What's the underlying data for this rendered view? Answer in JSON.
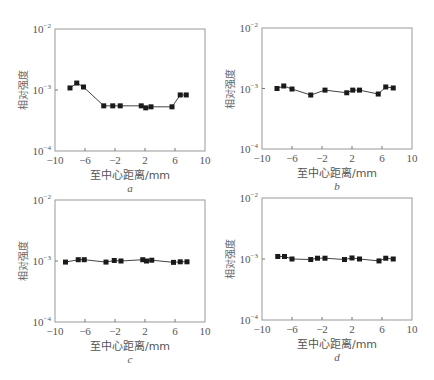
{
  "chart_data": [
    {
      "type": "scatter",
      "panel": "a",
      "xlabel": "至中心距离/mm",
      "ylabel": "相对强度",
      "xlim": [
        -10,
        10
      ],
      "ylim": [
        0.0001,
        0.01
      ],
      "yscale": "log",
      "xticks": [
        -10,
        -6,
        -2,
        2,
        6,
        10
      ],
      "yticks": [
        "10^-4",
        "10^-3",
        "10^-2"
      ],
      "series": [
        {
          "name": "a",
          "x": [
            -8.0,
            -7.1,
            -6.2,
            -3.5,
            -2.3,
            -1.3,
            1.5,
            2.1,
            2.8,
            5.6,
            6.7,
            7.5
          ],
          "y": [
            0.00108,
            0.0013,
            0.00112,
            0.00055,
            0.00055,
            0.00055,
            0.00055,
            0.00051,
            0.00053,
            0.00053,
            0.00083,
            0.00083
          ]
        }
      ]
    },
    {
      "type": "scatter",
      "panel": "b",
      "xlabel": "至中心距离/mm",
      "ylabel": "相对强度",
      "xlim": [
        -10,
        10
      ],
      "ylim": [
        0.0001,
        0.01
      ],
      "yscale": "log",
      "xticks": [
        -10,
        -6,
        -2,
        2,
        6,
        10
      ],
      "yticks": [
        "10^-4",
        "10^-3",
        "10^-2"
      ],
      "series": [
        {
          "name": "b",
          "x": [
            -8.0,
            -7.1,
            -6.0,
            -3.5,
            -1.6,
            1.3,
            2.1,
            3.0,
            5.5,
            6.5,
            7.5
          ],
          "y": [
            0.001,
            0.0011,
            0.00098,
            0.00078,
            0.00094,
            0.00085,
            0.00094,
            0.00094,
            0.00081,
            0.00106,
            0.00102
          ]
        }
      ]
    },
    {
      "type": "scatter",
      "panel": "c",
      "xlabel": "至中心距离/mm",
      "ylabel": "相对强度",
      "xlim": [
        -10,
        10
      ],
      "ylim": [
        0.0001,
        0.01
      ],
      "yscale": "log",
      "xticks": [
        -10,
        -6,
        -2,
        2,
        6,
        10
      ],
      "yticks": [
        "10^-4",
        "10^-3",
        "10^-2"
      ],
      "series": [
        {
          "name": "c",
          "x": [
            -8.6,
            -6.9,
            -6.1,
            -3.2,
            -2.1,
            -1.2,
            1.7,
            2.2,
            2.9,
            5.8,
            6.7,
            7.6
          ],
          "y": [
            0.00096,
            0.00105,
            0.00105,
            0.00096,
            0.00102,
            0.001,
            0.00105,
            0.001,
            0.00103,
            0.00095,
            0.00097,
            0.00097
          ]
        }
      ]
    },
    {
      "type": "scatter",
      "panel": "d",
      "xlabel": "至中心距离/mm",
      "ylabel": "相对强度",
      "xlim": [
        -10,
        10
      ],
      "ylim": [
        0.0001,
        0.01
      ],
      "yscale": "log",
      "xticks": [
        -10,
        -6,
        -2,
        2,
        6,
        10
      ],
      "yticks": [
        "10^-4",
        "10^-3",
        "10^-2"
      ],
      "series": [
        {
          "name": "d",
          "x": [
            -7.9,
            -7.0,
            -6.0,
            -3.5,
            -2.6,
            -1.6,
            1.0,
            2.0,
            3.0,
            5.6,
            6.5,
            7.5
          ],
          "y": [
            0.0011,
            0.0011,
            0.001,
            0.00098,
            0.00103,
            0.00103,
            0.00098,
            0.00104,
            0.001,
            0.00093,
            0.00103,
            0.001
          ]
        }
      ]
    }
  ],
  "panels": [
    {
      "letter": "a",
      "frame": {
        "x": 55,
        "y": 29,
        "w": 150,
        "h": 122
      }
    },
    {
      "letter": "b",
      "frame": {
        "x": 262,
        "y": 28,
        "w": 150,
        "h": 121
      }
    },
    {
      "letter": "c",
      "frame": {
        "x": 55,
        "y": 200,
        "w": 150,
        "h": 122
      }
    },
    {
      "letter": "d",
      "frame": {
        "x": 262,
        "y": 198,
        "w": 150,
        "h": 122
      }
    }
  ],
  "labels": {
    "xlabel": "至中心距离/mm",
    "ylabel": "相对强度",
    "ytick_base": "10",
    "ytick_exps": [
      "−4",
      "−3",
      "−2"
    ],
    "xtick_labels": [
      "−10",
      "−6",
      "−2",
      "2",
      "6",
      "10"
    ]
  }
}
